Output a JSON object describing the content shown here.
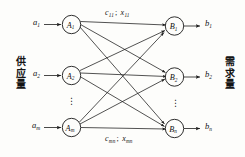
{
  "diagram": {
    "background_color": "#fdfdfb",
    "stroke_color": "#1a1a1a",
    "left_side_label": {
      "chars": [
        "供",
        "应",
        "量"
      ],
      "meaning": "supply"
    },
    "right_side_label": {
      "chars": [
        "需",
        "求",
        "量"
      ],
      "meaning": "demand"
    },
    "supply_inputs": [
      {
        "base": "a",
        "sub": "1"
      },
      {
        "base": "a",
        "sub": "2"
      },
      {
        "base": "a",
        "sub": "m"
      }
    ],
    "demand_outputs": [
      {
        "base": "b",
        "sub": "1"
      },
      {
        "base": "b",
        "sub": "2"
      },
      {
        "base": "b",
        "sub": "n"
      }
    ],
    "source_nodes": [
      {
        "base": "A",
        "sub": "1"
      },
      {
        "base": "A",
        "sub": "2"
      },
      {
        "base": "A",
        "sub": "m"
      }
    ],
    "sink_nodes": [
      {
        "base": "B",
        "sub": "1"
      },
      {
        "base": "B",
        "sub": "2"
      },
      {
        "base": "B",
        "sub": "n"
      }
    ],
    "edge_labels": [
      {
        "cost_base": "c",
        "cost_sub": "11",
        "separator": ";",
        "flow_base": "x",
        "flow_sub": "11"
      },
      {
        "cost_base": "c",
        "cost_sub": "mn",
        "separator": ";",
        "flow_base": "x",
        "flow_sub": "mn"
      }
    ],
    "ellipsis": "⋮"
  }
}
